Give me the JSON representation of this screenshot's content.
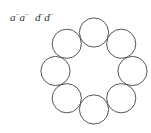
{
  "labels": {
    "group1": [
      {
        "base": "a",
        "sup": "−"
      },
      {
        "base": "a",
        "sup": "−"
      }
    ],
    "group2": [
      {
        "base": "d",
        "sup": "−"
      },
      {
        "base": "d",
        "sup": "−"
      }
    ]
  },
  "ring": {
    "center": [
      94,
      71
    ],
    "ring_radius": 38.5,
    "circle_radius": 14.6,
    "count": 8,
    "stroke": "#555555",
    "fill": "#ffffff"
  }
}
